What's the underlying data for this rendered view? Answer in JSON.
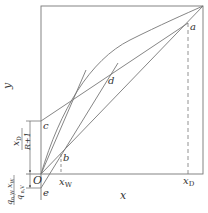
{
  "diagram": {
    "axes": {
      "x_label": "x",
      "y_label": "y",
      "origin_label": "O",
      "x_ticks": [
        {
          "label": "x",
          "sub": "W"
        },
        {
          "label": "x",
          "sub": "D"
        }
      ]
    },
    "points": {
      "a": "a",
      "b": "b",
      "c": "c",
      "d": "d",
      "e": "e"
    },
    "dimension_labels": {
      "upper_num": "x",
      "upper_num_sub": "D",
      "upper_den": "R+1",
      "lower_num": "q",
      "lower_num_sub": "n,W",
      "lower_num_x": "x",
      "lower_num_x_sub": "W",
      "lower_den": "q",
      "lower_den_sub": "n,V",
      "lower_den_prime": "′"
    },
    "colors": {
      "line": "#777777",
      "text": "#333333",
      "background": "#ffffff"
    }
  }
}
